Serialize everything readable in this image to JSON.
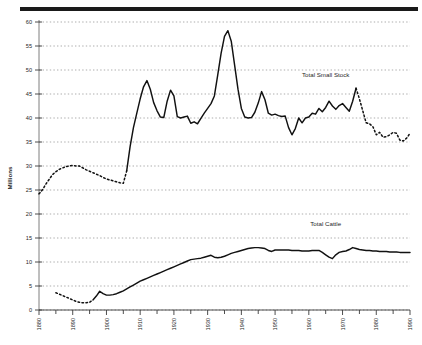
{
  "chart_data": {
    "type": "line",
    "title": "",
    "xlabel": "",
    "ylabel": "Millions",
    "xlim": [
      1880,
      1990
    ],
    "ylim": [
      0,
      60
    ],
    "grid": true,
    "grid_axis": "y",
    "legend": "inline-annotation",
    "x_ticks_major": [
      1880,
      1890,
      1900,
      1910,
      1920,
      1930,
      1940,
      1950,
      1960,
      1970,
      1980,
      1990
    ],
    "x_ticks_minor_step": 5,
    "y_ticks": [
      0,
      5,
      10,
      15,
      20,
      25,
      30,
      35,
      40,
      45,
      50,
      55,
      60
    ],
    "series": [
      {
        "name": "Total Small Stock",
        "style": "solid-with-dashed-segments",
        "color": "#111111",
        "dashed_ranges": [
          [
            1880,
            1905
          ],
          [
            1974,
            1990
          ]
        ],
        "x": [
          1880,
          1881,
          1882,
          1883,
          1884,
          1885,
          1886,
          1887,
          1888,
          1889,
          1890,
          1891,
          1892,
          1893,
          1894,
          1895,
          1896,
          1897,
          1898,
          1899,
          1900,
          1901,
          1902,
          1903,
          1904,
          1905,
          1906,
          1907,
          1908,
          1909,
          1910,
          1911,
          1912,
          1913,
          1914,
          1915,
          1916,
          1917,
          1918,
          1919,
          1920,
          1921,
          1922,
          1923,
          1924,
          1925,
          1926,
          1927,
          1928,
          1929,
          1930,
          1931,
          1932,
          1933,
          1934,
          1935,
          1936,
          1937,
          1938,
          1939,
          1940,
          1941,
          1942,
          1943,
          1944,
          1945,
          1946,
          1947,
          1948,
          1949,
          1950,
          1951,
          1952,
          1953,
          1954,
          1955,
          1956,
          1957,
          1958,
          1959,
          1960,
          1961,
          1962,
          1963,
          1964,
          1965,
          1966,
          1967,
          1968,
          1969,
          1970,
          1971,
          1972,
          1973,
          1974,
          1975,
          1976,
          1977,
          1978,
          1979,
          1980,
          1981,
          1982,
          1983,
          1984,
          1985,
          1986,
          1987,
          1988,
          1989,
          1990
        ],
        "values": [
          24.2,
          25.0,
          26.2,
          27.2,
          28.2,
          28.8,
          29.3,
          29.6,
          29.9,
          30.0,
          30.1,
          30.0,
          30.0,
          29.6,
          29.2,
          28.9,
          28.6,
          28.3,
          28.0,
          27.6,
          27.3,
          27.1,
          26.9,
          26.7,
          26.5,
          26.4,
          29.0,
          34.0,
          38.0,
          41.0,
          44.0,
          46.5,
          47.8,
          46.0,
          43.2,
          41.5,
          40.2,
          40.1,
          43.5,
          45.8,
          44.6,
          40.3,
          40.0,
          40.2,
          40.4,
          38.9,
          39.2,
          38.8,
          39.9,
          41.0,
          42.0,
          43.0,
          44.6,
          49.0,
          53.5,
          57.0,
          58.2,
          56.0,
          51.0,
          46.0,
          42.0,
          40.2,
          40.0,
          40.1,
          41.2,
          43.1,
          45.5,
          43.8,
          41.0,
          40.6,
          40.8,
          40.5,
          40.3,
          40.4,
          38.0,
          36.5,
          37.8,
          40.0,
          39.0,
          40.0,
          40.2,
          41.0,
          40.8,
          42.0,
          41.3,
          42.2,
          43.5,
          42.5,
          41.8,
          42.6,
          43.0,
          42.2,
          41.4,
          43.5,
          46.2,
          44.0,
          41.5,
          39.0,
          38.8,
          38.2,
          36.5,
          37.0,
          36.0,
          36.1,
          36.5,
          37.0,
          36.8,
          35.4,
          35.2,
          35.8,
          36.8
        ]
      },
      {
        "name": "Total Cattle",
        "style": "solid-with-dashed-segments",
        "color": "#111111",
        "dashed_ranges": [
          [
            1885,
            1895
          ]
        ],
        "x": [
          1885,
          1886,
          1887,
          1888,
          1889,
          1890,
          1891,
          1892,
          1893,
          1894,
          1895,
          1896,
          1897,
          1898,
          1899,
          1900,
          1901,
          1902,
          1903,
          1904,
          1905,
          1906,
          1907,
          1908,
          1909,
          1910,
          1911,
          1912,
          1913,
          1914,
          1915,
          1916,
          1917,
          1918,
          1919,
          1920,
          1921,
          1922,
          1923,
          1924,
          1925,
          1926,
          1927,
          1928,
          1929,
          1930,
          1931,
          1932,
          1933,
          1934,
          1935,
          1936,
          1937,
          1938,
          1939,
          1940,
          1941,
          1942,
          1943,
          1944,
          1945,
          1946,
          1947,
          1948,
          1949,
          1950,
          1951,
          1952,
          1953,
          1954,
          1955,
          1956,
          1957,
          1958,
          1959,
          1960,
          1961,
          1962,
          1963,
          1964,
          1965,
          1966,
          1967,
          1968,
          1969,
          1970,
          1971,
          1972,
          1973,
          1974,
          1975,
          1976,
          1977,
          1978,
          1979,
          1980,
          1981,
          1982,
          1983,
          1984,
          1985,
          1986,
          1987,
          1988,
          1989,
          1990
        ],
        "values": [
          3.6,
          3.3,
          3.0,
          2.7,
          2.4,
          2.1,
          1.8,
          1.6,
          1.5,
          1.5,
          1.6,
          2.1,
          2.9,
          3.9,
          3.4,
          3.1,
          3.1,
          3.2,
          3.4,
          3.7,
          4.0,
          4.4,
          4.8,
          5.2,
          5.6,
          6.0,
          6.3,
          6.6,
          6.9,
          7.2,
          7.5,
          7.8,
          8.1,
          8.4,
          8.7,
          9.0,
          9.3,
          9.6,
          9.9,
          10.2,
          10.5,
          10.6,
          10.7,
          10.8,
          11.0,
          11.2,
          11.4,
          11.0,
          10.9,
          11.0,
          11.2,
          11.5,
          11.8,
          12.0,
          12.2,
          12.4,
          12.6,
          12.8,
          12.9,
          13.0,
          13.0,
          12.9,
          12.8,
          12.4,
          12.2,
          12.5,
          12.5,
          12.5,
          12.5,
          12.5,
          12.4,
          12.4,
          12.4,
          12.3,
          12.3,
          12.3,
          12.4,
          12.4,
          12.4,
          12.0,
          11.5,
          11.0,
          10.7,
          11.5,
          12.0,
          12.2,
          12.3,
          12.6,
          13.0,
          12.8,
          12.6,
          12.5,
          12.4,
          12.4,
          12.3,
          12.3,
          12.2,
          12.2,
          12.2,
          12.1,
          12.1,
          12.1,
          12.0,
          12.0,
          12.0,
          12.0
        ]
      }
    ],
    "annotations": [
      {
        "text": "Total Small Stock",
        "x": 1965,
        "y": 48.5
      },
      {
        "text": "Total Cattle",
        "x": 1965,
        "y": 17.5
      }
    ]
  },
  "axis": {
    "y_title": "Millions",
    "y_tick_labels": [
      "0",
      "5",
      "10",
      "15",
      "20",
      "25",
      "30",
      "35",
      "40",
      "45",
      "50",
      "55",
      "60"
    ],
    "x_tick_labels": [
      "1880",
      "1890",
      "1900",
      "1910",
      "1920",
      "1930",
      "1940",
      "1950",
      "1960",
      "1970",
      "1980",
      "1990"
    ]
  }
}
